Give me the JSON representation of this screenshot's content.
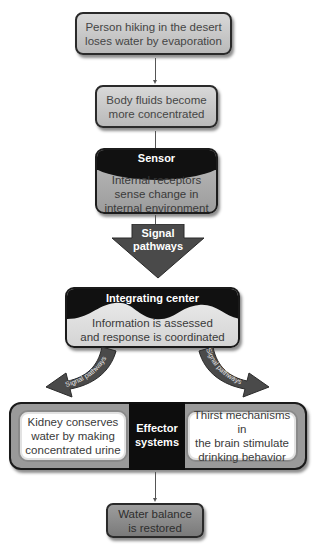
{
  "diagram": {
    "type": "flowchart",
    "nodes": {
      "stimulus": {
        "line1": "Person hiking in the desert",
        "line2": "loses water by evaporation"
      },
      "change": {
        "line1": "Body fluids become",
        "line2": "more concentrated"
      },
      "sensor": {
        "title": "Sensor",
        "line1": "Internal receptors",
        "line2": "sense change in",
        "line3": "internal environment"
      },
      "signal_main": {
        "line1": "Signal",
        "line2": "pathways"
      },
      "integrating_center": {
        "title": "Integrating center",
        "line1": "Information is assessed",
        "line2": "and response is coordinated"
      },
      "signal_left": {
        "label": "Signal pathways"
      },
      "signal_right": {
        "label": "Signal pathways"
      },
      "effector": {
        "title_line1": "Effector",
        "title_line2": "systems",
        "left": {
          "line1": "Kidney conserves",
          "line2": "water by making",
          "line3": "concentrated urine"
        },
        "right": {
          "line1": "Thirst mechanisms in",
          "line2": "the brain stimulate",
          "line3": "drinking behavior"
        }
      },
      "outcome": {
        "line1": "Water balance",
        "line2": "is restored"
      }
    },
    "edges": [
      {
        "from": "stimulus",
        "to": "change"
      },
      {
        "from": "change",
        "to": "sensor"
      },
      {
        "from": "sensor",
        "to": "integrating_center",
        "via": "signal_main"
      },
      {
        "from": "integrating_center",
        "to": "effector.left",
        "via": "signal_left"
      },
      {
        "from": "integrating_center",
        "to": "effector.right",
        "via": "signal_right"
      },
      {
        "from": "effector",
        "to": "outcome"
      }
    ],
    "colors": {
      "box_light": "#c8c8c8",
      "box_dark": "#8a8a8a",
      "header_black": "#111111",
      "arrow_gray": "#4a4a4a",
      "white": "#ffffff"
    }
  }
}
